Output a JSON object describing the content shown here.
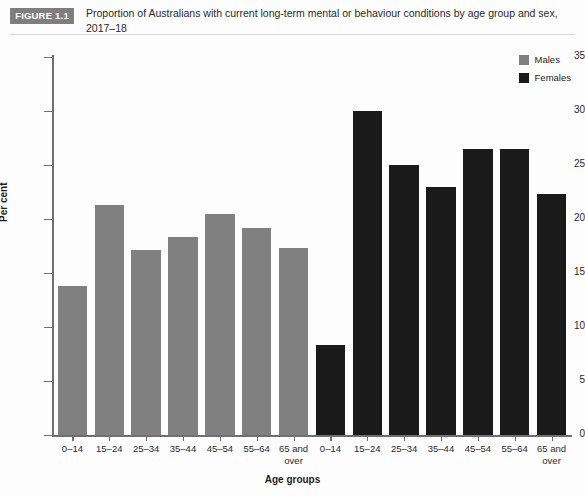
{
  "header": {
    "tag": "FIGURE 1.1",
    "title": "Proportion of Australians with current long-term mental or behaviour conditions by age group and sex, 2017–18"
  },
  "legend": {
    "position": "top-right",
    "items": [
      {
        "label": "Males",
        "color": "#808080"
      },
      {
        "label": "Females",
        "color": "#1a1a1a"
      }
    ]
  },
  "axes": {
    "ylabel": "Per cent",
    "xlabel": "Age groups",
    "yticks": [
      "0",
      "5",
      "10",
      "15",
      "20",
      "25",
      "30",
      "35"
    ]
  },
  "chart_data": {
    "type": "bar",
    "title": "Proportion of Australians with current long-term mental or behaviour conditions by age group and sex, 2017–18",
    "xlabel": "Age groups",
    "ylabel": "Per cent",
    "ylim": [
      0,
      35
    ],
    "ytick_step": 5,
    "grid": false,
    "legend_position": "top-right",
    "categories": [
      "0–14",
      "15–24",
      "25–34",
      "35–44",
      "45–54",
      "55–64",
      "65 and over"
    ],
    "series": [
      {
        "name": "Males",
        "color": "#808080",
        "values": [
          13.8,
          21.3,
          17.1,
          18.3,
          20.5,
          19.2,
          17.3
        ]
      },
      {
        "name": "Females",
        "color": "#1a1a1a",
        "values": [
          8.3,
          30.0,
          25.0,
          23.0,
          26.5,
          26.5,
          22.3
        ]
      }
    ]
  }
}
